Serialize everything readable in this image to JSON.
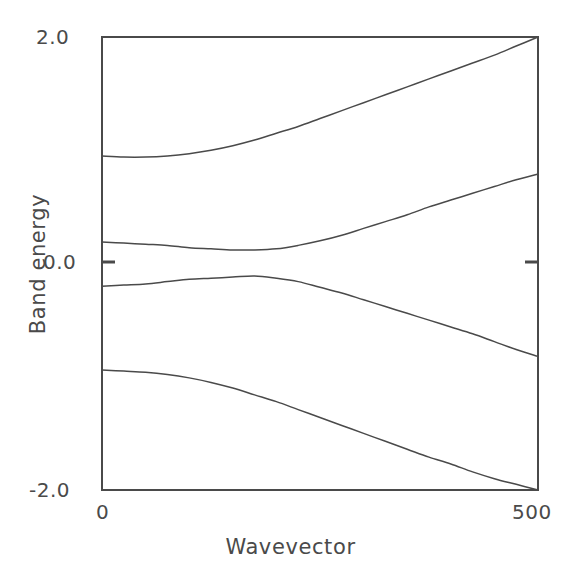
{
  "chart_data": {
    "type": "line",
    "title": "",
    "subtitle": "",
    "xlabel": "Wavevector",
    "ylabel": "Band energy",
    "xlim": [
      0,
      500
    ],
    "ylim": [
      -2.0,
      2.0
    ],
    "grid": false,
    "legend": "none",
    "xticks": [
      {
        "value": 0,
        "label": "0"
      },
      {
        "value": 500,
        "label": "500"
      }
    ],
    "yticks": [
      {
        "value": 2.0,
        "label": "2.0"
      },
      {
        "value": 0.0,
        "label": "0.0"
      },
      {
        "value": -2.0,
        "label": "-2.0"
      }
    ],
    "annotations": [],
    "series": [
      {
        "name": "band-1",
        "x": [
          0,
          25,
          50,
          75,
          100,
          125,
          150,
          175,
          200,
          225,
          250,
          275,
          300,
          325,
          350,
          375,
          400,
          425,
          450,
          475,
          500
        ],
        "values": [
          0.95,
          0.94,
          0.94,
          0.95,
          0.97,
          1.0,
          1.04,
          1.09,
          1.15,
          1.21,
          1.28,
          1.35,
          1.42,
          1.49,
          1.56,
          1.63,
          1.7,
          1.77,
          1.84,
          1.92,
          2.0
        ]
      },
      {
        "name": "band-2",
        "x": [
          0,
          25,
          50,
          75,
          100,
          125,
          150,
          175,
          200,
          225,
          250,
          275,
          300,
          325,
          350,
          375,
          400,
          425,
          450,
          475,
          500
        ],
        "values": [
          0.19,
          0.18,
          0.17,
          0.16,
          0.14,
          0.13,
          0.12,
          0.12,
          0.13,
          0.16,
          0.2,
          0.25,
          0.31,
          0.37,
          0.43,
          0.5,
          0.56,
          0.62,
          0.68,
          0.74,
          0.79
        ]
      },
      {
        "name": "band-3",
        "x": [
          0,
          25,
          50,
          75,
          100,
          125,
          150,
          175,
          200,
          225,
          250,
          275,
          300,
          325,
          350,
          375,
          400,
          425,
          450,
          475,
          500
        ],
        "values": [
          -0.2,
          -0.19,
          -0.18,
          -0.16,
          -0.14,
          -0.13,
          -0.12,
          -0.11,
          -0.13,
          -0.16,
          -0.21,
          -0.26,
          -0.32,
          -0.38,
          -0.44,
          -0.5,
          -0.56,
          -0.62,
          -0.69,
          -0.76,
          -0.82
        ]
      },
      {
        "name": "band-4",
        "x": [
          0,
          25,
          50,
          75,
          100,
          125,
          150,
          175,
          200,
          225,
          250,
          275,
          300,
          325,
          350,
          375,
          400,
          425,
          450,
          475,
          500
        ],
        "values": [
          -0.94,
          -0.95,
          -0.96,
          -0.98,
          -1.01,
          -1.05,
          -1.1,
          -1.16,
          -1.22,
          -1.29,
          -1.36,
          -1.43,
          -1.5,
          -1.57,
          -1.64,
          -1.71,
          -1.77,
          -1.84,
          -1.9,
          -1.95,
          -2.0
        ]
      }
    ]
  },
  "axes": {
    "frame_color": "#4a4a4a",
    "line_color": "#4a4a4a"
  },
  "labels": {
    "ylabel": "Band energy",
    "xlabel": "Wavevector",
    "ytick_top": "2.0",
    "ytick_zero": "0.0",
    "ytick_bottom": "-2.0",
    "xtick_left": "0",
    "xtick_right": "500"
  }
}
